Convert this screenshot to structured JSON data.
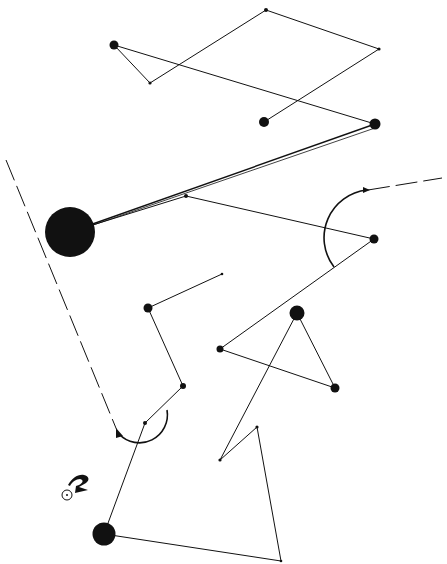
{
  "diagram": {
    "type": "abstract-node-link-drawing",
    "width": 447,
    "height": 564,
    "colors": {
      "background": "#ffffff",
      "ink": "#111111"
    },
    "nodes": [
      {
        "id": "A",
        "x": 114,
        "y": 45,
        "r": 4.5
      },
      {
        "id": "B",
        "x": 150,
        "y": 83,
        "r": 1.6
      },
      {
        "id": "C",
        "x": 266,
        "y": 10,
        "r": 2
      },
      {
        "id": "D",
        "x": 379,
        "y": 49,
        "r": 1.6
      },
      {
        "id": "E",
        "x": 264,
        "y": 122,
        "r": 5
      },
      {
        "id": "F",
        "x": 375,
        "y": 124,
        "r": 5.5
      },
      {
        "id": "G",
        "x": 70,
        "y": 232,
        "r": 25
      },
      {
        "id": "H",
        "x": 186,
        "y": 196,
        "r": 2
      },
      {
        "id": "I",
        "x": 374,
        "y": 239,
        "r": 4.5
      },
      {
        "id": "J",
        "x": 148,
        "y": 308,
        "r": 4.5
      },
      {
        "id": "K",
        "x": 222,
        "y": 274,
        "r": 1.3
      },
      {
        "id": "L",
        "x": 183,
        "y": 386,
        "r": 3
      },
      {
        "id": "M",
        "x": 145,
        "y": 423,
        "r": 2
      },
      {
        "id": "N",
        "x": 297,
        "y": 313,
        "r": 7.5
      },
      {
        "id": "O",
        "x": 220,
        "y": 349,
        "r": 3.5
      },
      {
        "id": "P",
        "x": 335,
        "y": 388,
        "r": 4.5
      },
      {
        "id": "Q",
        "x": 220,
        "y": 460,
        "r": 1.6
      },
      {
        "id": "R",
        "x": 257,
        "y": 427,
        "r": 1.6
      },
      {
        "id": "S",
        "x": 104,
        "y": 534,
        "r": 11.5
      },
      {
        "id": "T",
        "x": 281,
        "y": 561,
        "r": 1.3
      }
    ],
    "edges": [
      {
        "from": "A",
        "to": "B"
      },
      {
        "from": "B",
        "to": "C"
      },
      {
        "from": "C",
        "to": "D"
      },
      {
        "from": "D",
        "to": "E"
      },
      {
        "from": "A",
        "to": "F"
      },
      {
        "from": "F",
        "to": "G",
        "weight": 1.4
      },
      {
        "from": "G",
        "to": "H"
      },
      {
        "from": "H",
        "to": "I"
      },
      {
        "from": "I",
        "to": "O"
      },
      {
        "from": "O",
        "to": "P"
      },
      {
        "from": "P",
        "to": "N"
      },
      {
        "from": "N",
        "to": "Q"
      },
      {
        "from": "Q",
        "to": "R"
      },
      {
        "from": "R",
        "to": "T"
      },
      {
        "from": "T",
        "to": "S"
      },
      {
        "from": "S",
        "to": "M"
      },
      {
        "from": "M",
        "to": "L"
      },
      {
        "from": "L",
        "to": "J"
      },
      {
        "from": "J",
        "to": "K"
      }
    ],
    "dashed_lines": [
      {
        "name": "left-dashed-trajectory",
        "x1": 6,
        "y1": 160,
        "x2": 118,
        "y2": 433
      },
      {
        "name": "right-dashed-trajectory",
        "x1": 368,
        "y1": 190,
        "x2": 442,
        "y2": 178
      }
    ],
    "arcs": [
      {
        "name": "arc-around-M",
        "path": "M 119 434 A 28 28 0 0 0 167 410"
      },
      {
        "name": "arc-around-I",
        "path": "M 334 267 A 48 48 0 0 1 367 190"
      }
    ],
    "symbol": {
      "name": "origin-marker",
      "cx": 67,
      "cy": 495,
      "r": 5
    }
  }
}
